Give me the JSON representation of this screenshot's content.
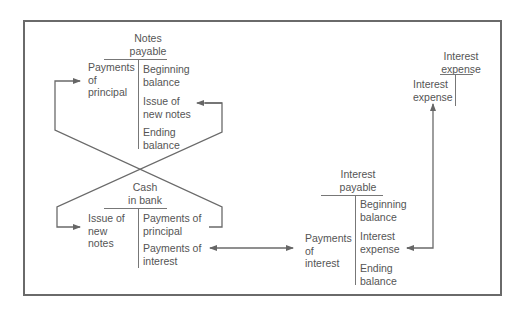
{
  "accounts": {
    "notes_payable": {
      "title": "Notes\npayable",
      "debit": [
        "Payments\nof\nprincipal"
      ],
      "credit": [
        "Beginning\nbalance",
        "Issue of\nnew notes",
        "Ending\nbalance"
      ]
    },
    "cash_in_bank": {
      "title": "Cash\nin bank",
      "debit": [
        "Issue of\nnew\nnotes"
      ],
      "credit": [
        "Payments of\nprincipal",
        "Payments of\ninterest"
      ]
    },
    "interest_payable": {
      "title": "Interest\npayable",
      "debit": [
        "Payments\nof\ninterest"
      ],
      "credit": [
        "Beginning\nbalance",
        "Interest\nexpense",
        "Ending\nbalance"
      ]
    },
    "interest_expense": {
      "title": "Interest\nexpense",
      "debit": [
        "Interest\nexpense"
      ],
      "credit": []
    }
  },
  "colors": {
    "line": "#6a6a6a",
    "text": "#555555"
  }
}
